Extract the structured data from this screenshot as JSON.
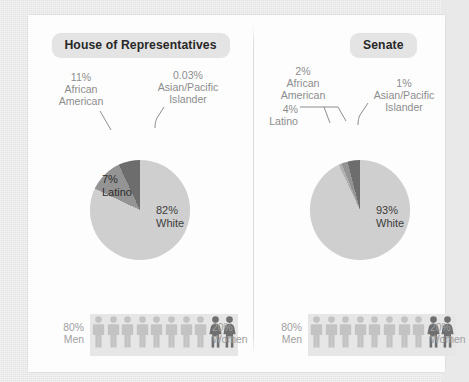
{
  "page": {
    "background_color": "#e9e9e9",
    "card_color": "#fdfdfd"
  },
  "palette": {
    "white_segment": "#cfcfcf",
    "asian_segment": "#b0b0b0",
    "african_american_segment": "#949494",
    "latino_segment": "#6d6d6d",
    "male_icon": "#c3c3c3",
    "female_icon": "#6f6f6f",
    "band_background": "#e6e6e6",
    "pill_background": "#e4e4e4",
    "callout_text": "#8d8d8d"
  },
  "panels": [
    {
      "id": "house",
      "title": "House of Representatives",
      "chart_data": {
        "type": "pie",
        "title": "House of Representatives",
        "labels": [
          "White",
          "Asian/Pacific Islander",
          "African American",
          "Latino"
        ],
        "values": [
          82,
          0.03,
          11,
          7
        ],
        "value_labels": [
          "82%",
          "0.03%",
          "11%",
          "7%"
        ],
        "colors": [
          "#cfcfcf",
          "#b0b0b0",
          "#949494",
          "#6d6d6d"
        ],
        "start_angle_deg": 0,
        "direction": "clockwise",
        "legend": "callouts"
      },
      "callouts": [
        {
          "name": "african-american",
          "pct": "11%",
          "line1": "African",
          "line2": "American"
        },
        {
          "name": "asian-pacific-islander",
          "pct": "0.03%",
          "line1": "Asian/Pacific",
          "line2": "Islander"
        }
      ],
      "inner_labels": [
        {
          "name": "white",
          "pct": "82%",
          "label": "White"
        },
        {
          "name": "latino",
          "pct": "7%",
          "label": "Latino"
        }
      ],
      "gender": {
        "type": "pictogram",
        "male_pct": "80%",
        "male_label": "Men",
        "female_pct": "20%",
        "female_label": "Women",
        "male_icons": 8,
        "female_icons": 2,
        "total_icons": 10
      }
    },
    {
      "id": "senate",
      "title": "Senate",
      "chart_data": {
        "type": "pie",
        "title": "Senate",
        "labels": [
          "White",
          "Asian/Pacific Islander",
          "African American",
          "Latino"
        ],
        "values": [
          93,
          1,
          2,
          4
        ],
        "value_labels": [
          "93%",
          "1%",
          "2%",
          "4%"
        ],
        "colors": [
          "#cfcfcf",
          "#b0b0b0",
          "#949494",
          "#6d6d6d"
        ],
        "start_angle_deg": 0,
        "direction": "clockwise",
        "legend": "callouts"
      },
      "callouts": [
        {
          "name": "african-american",
          "pct": "2%",
          "line1": "African",
          "line2": "American"
        },
        {
          "name": "asian-pacific-islander",
          "pct": "1%",
          "line1": "Asian/Pacific",
          "line2": "Islander"
        },
        {
          "name": "latino",
          "pct": "4%",
          "line1": "Latino",
          "line2": ""
        }
      ],
      "inner_labels": [
        {
          "name": "white",
          "pct": "93%",
          "label": "White"
        }
      ],
      "gender": {
        "type": "pictogram",
        "male_pct": "80%",
        "male_label": "Men",
        "female_pct": "20%",
        "female_label": "Women",
        "male_icons": 8,
        "female_icons": 2,
        "total_icons": 10
      }
    }
  ]
}
